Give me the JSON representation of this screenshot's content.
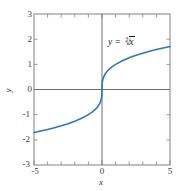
{
  "chart_data": {
    "type": "line",
    "title": "",
    "subtitle": "",
    "xlabel": "x",
    "ylabel": "y",
    "xlim": [
      -5,
      5
    ],
    "ylim": [
      -3,
      3
    ],
    "grid": false,
    "legend_position": "none",
    "annotations": [
      {
        "name": "curve-equation",
        "text_prefix": "y = ",
        "radical_index": "3",
        "radical_symbol": "√",
        "radicand": "x",
        "plain_text": "y = 3√x",
        "x": 2.1,
        "y": 2.05
      }
    ],
    "xticks": [
      -5,
      -4,
      -3,
      -2,
      -1,
      0,
      1,
      2,
      3,
      4,
      5
    ],
    "xticklabels": [
      "-5",
      "",
      "",
      "",
      "",
      "0",
      "",
      "",
      "",
      "",
      "5"
    ],
    "yticks": [
      -3,
      -2,
      -1,
      0,
      1,
      2,
      3
    ],
    "yticklabels": [
      "-3",
      "-2",
      "-1",
      "0",
      "1",
      "2",
      "3"
    ],
    "series": [
      {
        "name": "y = cbrt(x)",
        "color": "#3276b1",
        "linewidth": 1.6,
        "x": [
          -5,
          -4.5,
          -4,
          -3.5,
          -3,
          -2.5,
          -2,
          -1.5,
          -1,
          -0.75,
          -0.5,
          -0.35,
          -0.25,
          -0.15,
          -0.08,
          -0.03,
          -0.01,
          0,
          0.01,
          0.03,
          0.08,
          0.15,
          0.25,
          0.35,
          0.5,
          0.75,
          1,
          1.5,
          2,
          2.5,
          3,
          3.5,
          4,
          4.5,
          5
        ],
        "y": [
          -1.71,
          -1.651,
          -1.587,
          -1.518,
          -1.442,
          -1.357,
          -1.26,
          -1.145,
          -1,
          -0.909,
          -0.794,
          -0.705,
          -0.63,
          -0.531,
          -0.43,
          -0.311,
          -0.215,
          0,
          0.215,
          0.311,
          0.43,
          0.531,
          0.63,
          0.705,
          0.794,
          0.909,
          1,
          1.145,
          1.26,
          1.357,
          1.442,
          1.518,
          1.587,
          1.651,
          1.71
        ]
      }
    ],
    "colors": {
      "curve": "#3276b1",
      "frame": "#8c8c8c",
      "axis": "#6e6e6e",
      "tick_text": "#3d3d3d",
      "background": "#ffffff"
    }
  },
  "labels": {
    "y3": "3",
    "y2": "2",
    "y1": "1",
    "y0": "0",
    "ym1": "-1",
    "ym2": "-2",
    "ym3": "-3",
    "xm5": "-5",
    "x0": "0",
    "x5": "5",
    "x_axis_title": "x",
    "y_axis_title": "y"
  }
}
